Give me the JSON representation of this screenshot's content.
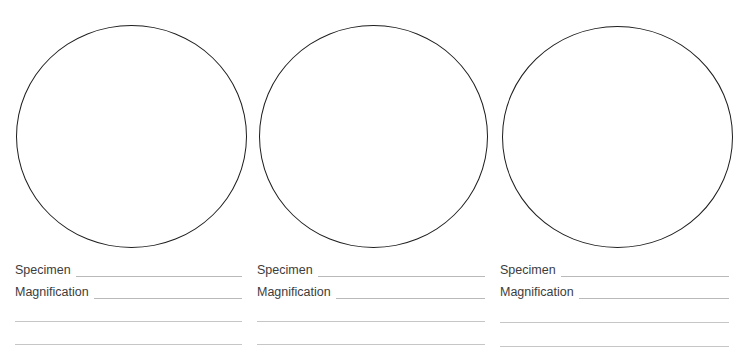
{
  "worksheet": {
    "panels": [
      {
        "id": 1,
        "specimen_label": "Specimen",
        "specimen_value": "",
        "magnification_label": "Magnification",
        "magnification_value": "",
        "notes": [
          "",
          ""
        ]
      },
      {
        "id": 2,
        "specimen_label": "Specimen",
        "specimen_value": "",
        "magnification_label": "Magnification",
        "magnification_value": "",
        "notes": [
          "",
          ""
        ]
      },
      {
        "id": 3,
        "specimen_label": "Specimen",
        "specimen_value": "",
        "magnification_label": "Magnification",
        "magnification_value": "",
        "notes": [
          "",
          ""
        ]
      }
    ],
    "colors": {
      "circle_outline": "#1e1e1e",
      "label_text": "#3c3c3c",
      "rule_line": "#b9b9b9",
      "background": "#ffffff"
    }
  }
}
